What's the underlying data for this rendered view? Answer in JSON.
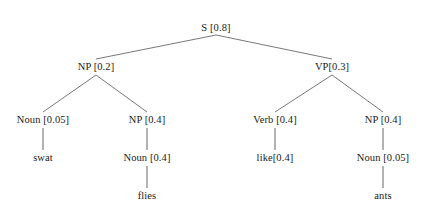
{
  "diagram": {
    "type": "probabilistic-parse-tree",
    "sentence": "swat flies like ants",
    "background_color": "#ffffff",
    "text_color": "#1a1a1a",
    "edge_color": "#555555",
    "nodes": [
      {
        "id": "s",
        "label": "S [0.8]",
        "symbol": "S",
        "probability": 0.8,
        "x": 216,
        "y": 28,
        "depth": 0
      },
      {
        "id": "np1",
        "label": "NP [0.2]",
        "symbol": "NP",
        "probability": 0.2,
        "x": 96,
        "y": 67,
        "depth": 1
      },
      {
        "id": "vp",
        "label": "VP[0.3]",
        "symbol": "VP",
        "probability": 0.3,
        "x": 332,
        "y": 67,
        "depth": 1
      },
      {
        "id": "noun1",
        "label": "Noun [0.05]",
        "symbol": "Noun",
        "probability": 0.05,
        "x": 43,
        "y": 120,
        "depth": 2
      },
      {
        "id": "np2",
        "label": "NP [0.4]",
        "symbol": "NP",
        "probability": 0.4,
        "x": 147,
        "y": 120,
        "depth": 2
      },
      {
        "id": "verb",
        "label": "Verb [0.4]",
        "symbol": "Verb",
        "probability": 0.4,
        "x": 275,
        "y": 120,
        "depth": 2
      },
      {
        "id": "np3",
        "label": "NP [0.4]",
        "symbol": "NP",
        "probability": 0.4,
        "x": 383,
        "y": 120,
        "depth": 2
      },
      {
        "id": "swat",
        "label": "swat",
        "symbol": "swat",
        "probability": null,
        "x": 43,
        "y": 158,
        "depth": 3,
        "terminal": true
      },
      {
        "id": "noun2",
        "label": "Noun [0.4]",
        "symbol": "Noun",
        "probability": 0.4,
        "x": 147,
        "y": 158,
        "depth": 3
      },
      {
        "id": "like",
        "label": "like[0.4]",
        "symbol": "like",
        "probability": 0.4,
        "x": 275,
        "y": 158,
        "depth": 3,
        "terminal": true
      },
      {
        "id": "noun3",
        "label": "Noun [0.05]",
        "symbol": "Noun",
        "probability": 0.05,
        "x": 383,
        "y": 158,
        "depth": 3
      },
      {
        "id": "flies",
        "label": "flies",
        "symbol": "flies",
        "probability": null,
        "x": 147,
        "y": 196,
        "depth": 4,
        "terminal": true
      },
      {
        "id": "ants",
        "label": "ants",
        "symbol": "ants",
        "probability": null,
        "x": 383,
        "y": 196,
        "depth": 4,
        "terminal": true
      }
    ],
    "edges": [
      {
        "from": "s",
        "to": "np1",
        "x1": 216,
        "y1": 35,
        "x2": 96,
        "y2": 59
      },
      {
        "from": "s",
        "to": "vp",
        "x1": 216,
        "y1": 35,
        "x2": 332,
        "y2": 59
      },
      {
        "from": "np1",
        "to": "noun1",
        "x1": 96,
        "y1": 75,
        "x2": 43,
        "y2": 112
      },
      {
        "from": "np1",
        "to": "np2",
        "x1": 96,
        "y1": 75,
        "x2": 147,
        "y2": 112
      },
      {
        "from": "vp",
        "to": "verb",
        "x1": 332,
        "y1": 75,
        "x2": 275,
        "y2": 112
      },
      {
        "from": "vp",
        "to": "np3",
        "x1": 332,
        "y1": 75,
        "x2": 383,
        "y2": 112
      },
      {
        "from": "noun1",
        "to": "swat",
        "x1": 43,
        "y1": 128,
        "x2": 43,
        "y2": 150
      },
      {
        "from": "np2",
        "to": "noun2",
        "x1": 147,
        "y1": 128,
        "x2": 147,
        "y2": 150
      },
      {
        "from": "verb",
        "to": "like",
        "x1": 275,
        "y1": 128,
        "x2": 275,
        "y2": 150
      },
      {
        "from": "np3",
        "to": "noun3",
        "x1": 383,
        "y1": 128,
        "x2": 383,
        "y2": 150
      },
      {
        "from": "noun2",
        "to": "flies",
        "x1": 147,
        "y1": 166,
        "x2": 147,
        "y2": 188
      },
      {
        "from": "noun3",
        "to": "ants",
        "x1": 383,
        "y1": 166,
        "x2": 383,
        "y2": 188
      }
    ]
  }
}
